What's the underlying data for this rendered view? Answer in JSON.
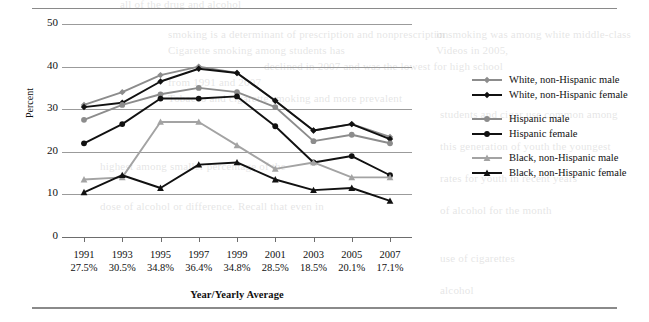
{
  "chart_data": {
    "type": "line",
    "title": "",
    "xlabel": "Year/Yearly Average",
    "ylabel": "Percent",
    "ylim": [
      0,
      50
    ],
    "yticks": [
      0,
      10,
      20,
      30,
      40,
      50
    ],
    "grid": true,
    "legend_position": "right",
    "categories": [
      "1991",
      "1993",
      "1995",
      "1997",
      "1999",
      "2001",
      "2003",
      "2005",
      "2007"
    ],
    "category_sublabels": [
      "27.5%",
      "30.5%",
      "34.8%",
      "36.4%",
      "34.8%",
      "28.5%",
      "18.5%",
      "20.1%",
      "17.1%"
    ],
    "series": [
      {
        "name": "White, non-Hispanic male",
        "color": "#8c8c8c",
        "marker": "diamond",
        "values": [
          31.0,
          34.0,
          38.0,
          40.0,
          38.5,
          32.0,
          25.0,
          26.5,
          23.5
        ]
      },
      {
        "name": "White, non-Hispanic female",
        "color": "#111111",
        "marker": "diamond",
        "values": [
          30.5,
          31.5,
          36.5,
          39.5,
          38.5,
          32.0,
          25.0,
          26.5,
          23.0
        ]
      },
      {
        "name": "Hispanic male",
        "color": "#8c8c8c",
        "marker": "circle",
        "values": [
          27.5,
          31.0,
          33.5,
          35.0,
          34.0,
          30.5,
          22.5,
          24.0,
          22.0
        ]
      },
      {
        "name": "Hispanic female",
        "color": "#111111",
        "marker": "circle",
        "values": [
          22.0,
          26.5,
          32.5,
          32.5,
          33.0,
          26.0,
          17.5,
          19.0,
          14.5
        ]
      },
      {
        "name": "Black, non-Hispanic male",
        "color": "#a3a3a3",
        "marker": "triangle",
        "values": [
          13.5,
          14.0,
          27.0,
          27.0,
          21.5,
          16.0,
          17.5,
          14.0,
          14.0
        ]
      },
      {
        "name": "Black, non-Hispanic female",
        "color": "#111111",
        "marker": "triangle",
        "values": [
          10.5,
          14.5,
          11.5,
          17.0,
          17.5,
          13.5,
          11.0,
          11.5,
          8.5
        ]
      }
    ]
  },
  "bleed_text": {
    "l1": "all of the drug and alcohol",
    "l2": "in smoking was among white middle-class",
    "l3": "Videos in 2005,",
    "l4": "smoking is a determinant of prescription and nonprescription",
    "l5": "Cigarette smoking among students has",
    "l6": "declined in 2007 and was the lowest for high school",
    "l7": "from 1991 and 2007",
    "l8": "Tobacco and cigarette smoking and more prevalent",
    "l9": "students and cigar use common among",
    "l10": "this generation of youth the youngest",
    "l11": "rates for youth in recent years",
    "l12": "of alcohol for the month",
    "l13": "highest among smaller percentage of the",
    "l14": "dose of alcohol or difference. Recall that even in",
    "l15": "use of cigarettes",
    "l16": "alcohol"
  }
}
